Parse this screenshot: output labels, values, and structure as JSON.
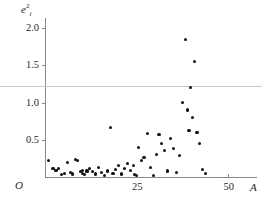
{
  "figure": {
    "background": "#ffffff",
    "point_color": "#111111",
    "axis_color": "#8a8a8a",
    "refline_color": "#c9c9c9",
    "origin_label": "O"
  },
  "chart_data": {
    "type": "scatter",
    "title": "",
    "subtitle": "",
    "xlabel": "A",
    "ylabel": "ê²ᵢ",
    "ylabel_base": "e",
    "ylabel_sub": "i",
    "ylabel_sup": "2",
    "grid": false,
    "legend": null,
    "xlim": [
      0,
      55
    ],
    "ylim": [
      0,
      2.15
    ],
    "xticks": [
      25,
      50
    ],
    "xtick_labels": [
      "25",
      "50"
    ],
    "yticks": [
      0.5,
      1.0,
      1.5,
      2.0
    ],
    "ytick_labels": [
      "0.5",
      "1.0",
      "1.5",
      "2.0"
    ],
    "annotations": [
      {
        "type": "hline",
        "y": 1.25,
        "label": "reference line"
      }
    ],
    "x": [
      1.0,
      2.2,
      3.0,
      3.6,
      4.5,
      5.4,
      6.2,
      7.0,
      7.6,
      8.4,
      9.0,
      9.6,
      10.2,
      10.2,
      10.8,
      11.5,
      12.3,
      13.0,
      13.8,
      14.6,
      15.4,
      16.2,
      17.0,
      17.8,
      18.6,
      19.4,
      20.2,
      21.0,
      21.8,
      22.6,
      23.4,
      24.2,
      24.6,
      25.0,
      25.6,
      26.3,
      27.1,
      28.0,
      28.8,
      29.6,
      30.4,
      31.2,
      32.0,
      32.8,
      33.6,
      34.4,
      35.2,
      36.0,
      36.8,
      37.6,
      38.4,
      39.0,
      39.4,
      39.8,
      40.4,
      41.0,
      41.6,
      42.2,
      43.0,
      44.0
    ],
    "y": [
      0.22,
      0.11,
      0.09,
      0.12,
      0.03,
      0.05,
      0.2,
      0.06,
      0.04,
      0.23,
      0.22,
      0.07,
      0.05,
      0.09,
      0.03,
      0.08,
      0.11,
      0.07,
      0.04,
      0.13,
      0.06,
      0.02,
      0.08,
      0.66,
      0.05,
      0.1,
      0.15,
      0.04,
      0.12,
      0.18,
      0.09,
      0.16,
      0.03,
      0.02,
      0.4,
      0.22,
      0.26,
      0.58,
      0.13,
      0.02,
      0.3,
      0.57,
      0.45,
      0.35,
      0.08,
      0.52,
      0.38,
      0.06,
      0.29,
      1.0,
      1.85,
      0.9,
      0.62,
      1.2,
      0.8,
      1.55,
      0.6,
      0.45,
      0.1,
      0.05
    ]
  }
}
